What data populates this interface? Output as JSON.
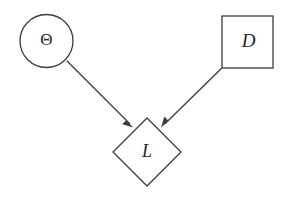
{
  "figure": {
    "kind": "influence-diagram",
    "width": 288,
    "height": 197,
    "background_color": "#ffffff",
    "stroke_color": "#3b3b3b",
    "text_color": "#262626",
    "stroke_width": 1.3
  },
  "nodes": [
    {
      "id": "theta",
      "label": "Θ",
      "shape": "circle",
      "role": "chance-node",
      "label_style": "upright",
      "font_size": 17,
      "cx": 46.5,
      "cy": 41,
      "r": 26.5
    },
    {
      "id": "decision",
      "label": "D",
      "shape": "square",
      "role": "decision-node",
      "label_style": "italic",
      "font_size": 19,
      "x": 222,
      "y": 16,
      "w": 51,
      "h": 52
    },
    {
      "id": "loss",
      "label": "L",
      "shape": "diamond",
      "role": "utility-node",
      "label_style": "italic",
      "font_size": 18,
      "cx": 147,
      "cy": 152,
      "rx": 34,
      "ry": 34
    }
  ],
  "edges": [
    {
      "id": "theta-to-loss",
      "from": "theta",
      "to": "loss",
      "x1": 66.8,
      "y1": 60.8,
      "x2": 133.5,
      "y2": 127.5,
      "arrowhead": "solid-triangle"
    },
    {
      "id": "decision-to-loss",
      "from": "decision",
      "to": "loss",
      "x1": 221.6,
      "y1": 68.2,
      "x2": 161.0,
      "y2": 127.8,
      "arrowhead": "solid-triangle"
    }
  ]
}
